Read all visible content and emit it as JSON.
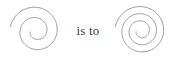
{
  "figure": {
    "type": "visual-analogy",
    "background_color": "#ffffff",
    "stroke_color": "#8c8c8c",
    "text_color": "#3b3b3b",
    "relation_label": "is to",
    "items": [
      {
        "id": "left",
        "name": "two-turn-spiral",
        "shape": "spiral",
        "turns": 2,
        "direction": "counterclockwise-inward",
        "center_x": 34,
        "center_y": 31,
        "outer_radius": 26,
        "inner_radius": 6,
        "start_angle_deg": 170,
        "sweep_deg": 700
      },
      {
        "id": "right",
        "name": "three-turn-spiral",
        "shape": "spiral",
        "turns": 3,
        "direction": "counterclockwise-inward",
        "center_x": 33,
        "center_y": 31,
        "outer_radius": 26,
        "inner_radius": 5,
        "start_angle_deg": 170,
        "sweep_deg": 1060
      }
    ]
  }
}
